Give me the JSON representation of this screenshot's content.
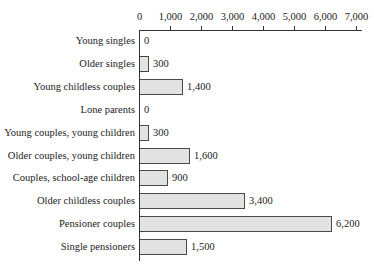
{
  "chart_data": {
    "type": "bar",
    "orientation": "horizontal",
    "title": "",
    "xlabel": "",
    "ylabel": "",
    "xlim": [
      0,
      7000
    ],
    "x_ticks": [
      "0",
      "1,000",
      "2,000",
      "3,000",
      "4,000",
      "5,000",
      "6,000",
      "7,000"
    ],
    "x_tick_values": [
      0,
      1000,
      2000,
      3000,
      4000,
      5000,
      6000,
      7000
    ],
    "axis_position": "top",
    "grid": false,
    "legend": null,
    "categories": [
      "Young singles",
      "Older singles",
      "Young childless couples",
      "Lone parents",
      "Young couples, young children",
      "Older couples, young children",
      "Couples, school-age children",
      "Older childless couples",
      "Pensioner couples",
      "Single pensioners"
    ],
    "values": [
      0,
      300,
      1400,
      0,
      300,
      1600,
      900,
      3400,
      6200,
      1500
    ],
    "value_labels": [
      "0",
      "300",
      "1,400",
      "0",
      "300",
      "1,600",
      "900",
      "3,400",
      "6,200",
      "1,500"
    ],
    "colors": {
      "bar_fill": "#e2e2e2",
      "bar_border": "#4a4a4a",
      "axis": "#333333"
    }
  }
}
